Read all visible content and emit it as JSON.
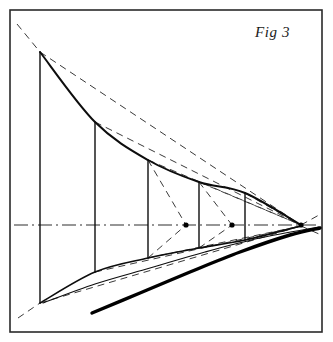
{
  "figure": {
    "label": "Fig 3",
    "label_position": {
      "x": 255,
      "y": 24
    },
    "caption_style": "italic-serif"
  },
  "canvas": {
    "width": 333,
    "height": 342,
    "background": "#ffffff"
  },
  "frame": {
    "name": "figure-border",
    "x": 10,
    "y": 10,
    "width": 312,
    "height": 322,
    "stroke": "#2a2a2a",
    "stroke_width": 1.6
  },
  "colors": {
    "solid_line": "#0d0d0d",
    "dashed_line": "#3a3a3a",
    "thick_curve": "#000000",
    "axis": "#2e2e2e",
    "frame": "#2a2a2a"
  },
  "chart_data": {
    "type": "line",
    "title": "Fig 3",
    "xlabel": "",
    "ylabel": "",
    "xlim": [
      10,
      322
    ],
    "ylim": [
      10,
      332
    ],
    "grid": false,
    "legend": null,
    "axis_line": {
      "name": "centre-axis",
      "y": 225,
      "x_start": 14,
      "x_end": 319,
      "style": "dash-dot"
    },
    "vanishing_point": {
      "x": 301,
      "y": 225
    },
    "station_lines": [
      {
        "id": "station-1",
        "x": 40,
        "y_top": 52,
        "y_bottom": 303,
        "chord": 251
      },
      {
        "id": "station-2",
        "x": 95,
        "y_top": 122,
        "y_bottom": 272,
        "chord": 150
      },
      {
        "id": "station-3",
        "x": 148,
        "y_top": 160,
        "y_bottom": 258,
        "chord": 98
      },
      {
        "id": "station-4",
        "x": 199,
        "y_top": 182,
        "y_bottom": 248,
        "chord": 66
      },
      {
        "id": "station-5",
        "x": 245,
        "y_top": 193,
        "y_bottom": 240,
        "chord": 47
      }
    ],
    "upper_edge": {
      "name": "upper-boundary-curve",
      "points": [
        [
          40,
          52
        ],
        [
          95,
          122
        ],
        [
          148,
          160
        ],
        [
          199,
          182
        ],
        [
          245,
          193
        ],
        [
          301,
          225
        ]
      ]
    },
    "lower_edge": {
      "name": "lower-boundary-curve",
      "points": [
        [
          40,
          303
        ],
        [
          95,
          272
        ],
        [
          148,
          258
        ],
        [
          199,
          248
        ],
        [
          245,
          240
        ],
        [
          301,
          226
        ]
      ]
    },
    "thick_trailing_curve": {
      "name": "thick-trailing-edge",
      "points": [
        [
          92,
          313
        ],
        [
          140,
          293
        ],
        [
          190,
          272
        ],
        [
          240,
          252
        ],
        [
          290,
          235
        ],
        [
          320,
          228
        ]
      ],
      "stroke_width": 3.4
    },
    "thin_lower_curve": {
      "name": "thin-lower-curve",
      "points": [
        [
          43,
          303
        ],
        [
          95,
          284
        ],
        [
          150,
          268
        ],
        [
          205,
          252
        ],
        [
          260,
          238
        ],
        [
          319,
          227
        ]
      ],
      "stroke_width": 1.1
    },
    "axis_markers": [
      {
        "name": "axis-node-1",
        "x": 186,
        "y": 225
      },
      {
        "name": "axis-node-2",
        "x": 232,
        "y": 225
      },
      {
        "name": "axis-node-3",
        "x": 301,
        "y": 225
      }
    ],
    "construction_lines": [
      {
        "id": "cl-upper-extension",
        "from": [
          17,
          24
        ],
        "to": [
          40,
          52
        ],
        "style": "dashed"
      },
      {
        "id": "cl-lower-extension",
        "from": [
          18,
          318
        ],
        "to": [
          40,
          303
        ],
        "style": "dashed"
      },
      {
        "id": "cl-top-1-to-vp",
        "from": [
          40,
          52
        ],
        "to": [
          301,
          225
        ],
        "style": "dashed"
      },
      {
        "id": "cl-top-2-to-vp",
        "from": [
          95,
          122
        ],
        "to": [
          301,
          225
        ],
        "style": "dashed"
      },
      {
        "id": "cl-top-3-to-vp",
        "from": [
          148,
          160
        ],
        "to": [
          301,
          225
        ],
        "style": "dashed"
      },
      {
        "id": "cl-top-4-to-vp",
        "from": [
          199,
          182
        ],
        "to": [
          301,
          225
        ],
        "style": "dashed"
      },
      {
        "id": "cl-bot-1-to-vp",
        "from": [
          40,
          303
        ],
        "to": [
          301,
          226
        ],
        "style": "dashed"
      },
      {
        "id": "cl-bot-2-to-vp",
        "from": [
          95,
          272
        ],
        "to": [
          301,
          226
        ],
        "style": "dashed"
      },
      {
        "id": "cl-bot-3-to-vp",
        "from": [
          148,
          258
        ],
        "to": [
          301,
          226
        ],
        "style": "dashed"
      },
      {
        "id": "cl-top-3-to-node1",
        "from": [
          148,
          160
        ],
        "to": [
          186,
          225
        ],
        "style": "dashed"
      },
      {
        "id": "cl-bot-3-to-node1",
        "from": [
          148,
          258
        ],
        "to": [
          186,
          225
        ],
        "style": "dashed"
      },
      {
        "id": "cl-top-4-to-node2",
        "from": [
          199,
          182
        ],
        "to": [
          232,
          225
        ],
        "style": "dashed"
      },
      {
        "id": "cl-bot-4-to-node2",
        "from": [
          199,
          248
        ],
        "to": [
          232,
          225
        ],
        "style": "dashed"
      },
      {
        "id": "cl-top-5-to-vp",
        "from": [
          245,
          193
        ],
        "to": [
          301,
          225
        ],
        "style": "dashed"
      },
      {
        "id": "cl-bot-5-to-vp",
        "from": [
          245,
          240
        ],
        "to": [
          301,
          226
        ],
        "style": "dashed"
      },
      {
        "id": "cl-vp-tail-upper",
        "from": [
          301,
          225
        ],
        "to": [
          319,
          215
        ],
        "style": "dashed"
      },
      {
        "id": "cl-vp-tail-lower",
        "from": [
          301,
          226
        ],
        "to": [
          319,
          234
        ],
        "style": "dashed"
      }
    ]
  }
}
